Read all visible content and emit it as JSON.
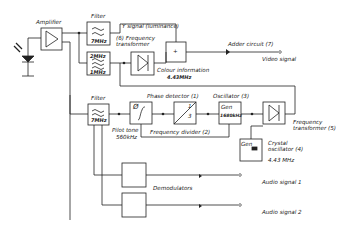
{
  "diagram": {
    "blocks": {
      "amplifier": {
        "label": "Amplifier"
      },
      "filter_top": {
        "label": "Filter",
        "freq": "7MHz"
      },
      "filter_mid": {
        "label": "Filter",
        "freq_top": "2MHz",
        "freq_bottom": "1MHz"
      },
      "frequency_transformer_6": {
        "label": "(6) Frequency transformer"
      },
      "adder": {
        "label": "Adder circuit (7)",
        "symbol": "+"
      },
      "filter_pilot": {
        "label": "Filter",
        "freq": "7MHz"
      },
      "phase_detector": {
        "label": "Phase detector (1)",
        "symbol": "Ø"
      },
      "frequency_divider": {
        "label": "Frequency divider (2)",
        "ratio_num": "1",
        "ratio_den": "3"
      },
      "oscillator": {
        "label": "Oscillator (3)",
        "inner": "Gen",
        "freq": "1680kHz"
      },
      "frequency_transformer_5": {
        "label": "Frequency transformer (5)"
      },
      "crystal_oscillator": {
        "label": "Crystal oscillator (4)",
        "freq": "4.43 MHz",
        "inner": "Gen"
      },
      "demodulators": {
        "label": "Demodulators"
      }
    },
    "signals": {
      "y_signal": "Y signal (luminance)",
      "colour_info": "Colour information",
      "colour_freq": "4.43MHz",
      "video_signal": "Video signal",
      "pilot_tone": "Pilot tone",
      "pilot_freq": "560kHz",
      "audio_1": "Audio signal 1",
      "audio_2": "Audio signal 2"
    }
  }
}
